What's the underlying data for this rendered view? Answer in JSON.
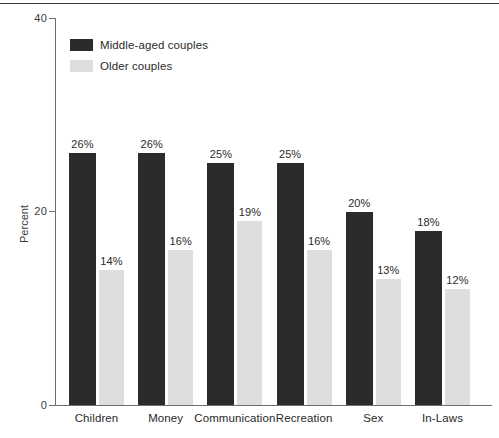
{
  "chart_data": {
    "type": "bar",
    "title": "",
    "xlabel": "",
    "ylabel": "Percent",
    "ylim": [
      0,
      40
    ],
    "yticks": [
      "0",
      "20",
      "40"
    ],
    "grid": false,
    "legend_position": "top-left",
    "categories": [
      "Children",
      "Money",
      "Communication",
      "Recreation",
      "Sex",
      "In-Laws"
    ],
    "series": [
      {
        "name": "Middle-aged couples",
        "color": "#2b2b2b",
        "values": [
          26,
          26,
          25,
          25,
          20,
          18
        ],
        "labels": [
          "26%",
          "26%",
          "25%",
          "25%",
          "20%",
          "18%"
        ]
      },
      {
        "name": "Older couples",
        "color": "#dedede",
        "values": [
          14,
          16,
          19,
          16,
          13,
          12
        ],
        "labels": [
          "14%",
          "16%",
          "19%",
          "16%",
          "13%",
          "12%"
        ]
      }
    ]
  },
  "axis": {
    "y_title": "Percent",
    "y_tick_0": "0",
    "y_tick_20": "20",
    "y_tick_40": "40"
  },
  "legend": {
    "items": [
      {
        "label": "Middle-aged couples",
        "color": "#2b2b2b"
      },
      {
        "label": "Older couples",
        "color": "#dedede"
      }
    ]
  }
}
